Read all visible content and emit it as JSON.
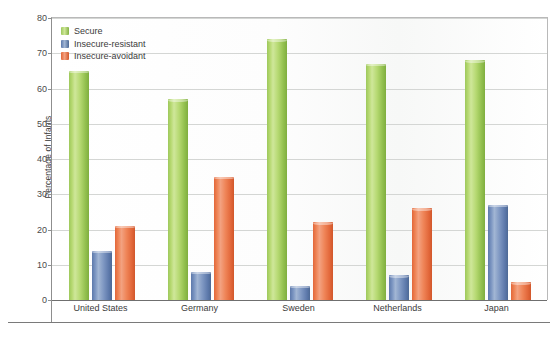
{
  "chart_data": {
    "type": "bar",
    "title": "",
    "subtitle": "",
    "xlabel": "",
    "ylabel": "Percentage of Infants",
    "ylim": [
      0,
      80
    ],
    "ytick_step": 10,
    "yticks": [
      "0",
      "10",
      "20",
      "30",
      "40",
      "50",
      "60",
      "70",
      "80"
    ],
    "grid": true,
    "legend_position": "top-left",
    "categories": [
      "United States",
      "Germany",
      "Sweden",
      "Netherlands",
      "Japan"
    ],
    "series": [
      {
        "name": "Secure",
        "color": "#9dc85c",
        "values": [
          65,
          57,
          74,
          67,
          68
        ]
      },
      {
        "name": "Insecure-resistant",
        "color": "#5d79ab",
        "values": [
          14,
          8,
          4,
          7,
          27
        ]
      },
      {
        "name": "Insecure-avoidant",
        "color": "#e2673a",
        "values": [
          21,
          35,
          22,
          26,
          5
        ]
      }
    ]
  },
  "colors": {
    "secure": "#9dc85c",
    "insecure_resistant": "#5d79ab",
    "insecure_avoidant": "#e2673a",
    "axis": "#7a7a7a",
    "gridline": "#d4d6d4",
    "text": "#3b3b3b",
    "background": "#ffffff"
  }
}
